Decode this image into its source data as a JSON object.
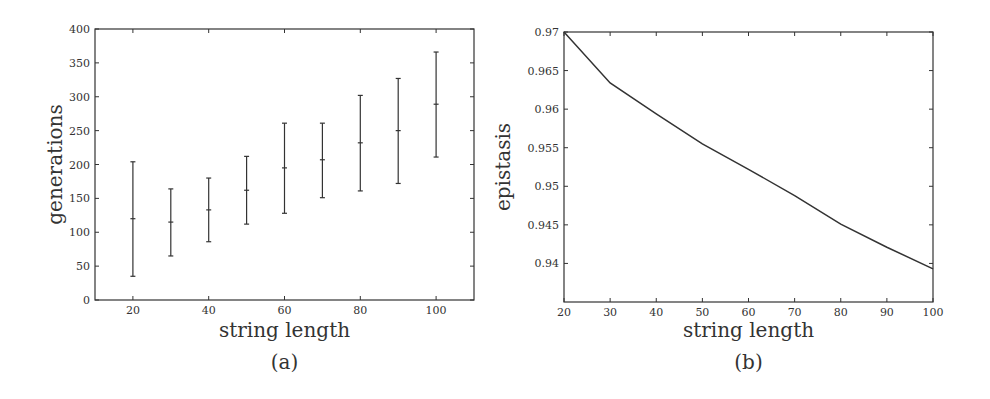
{
  "chart_data": [
    {
      "id": "a",
      "type": "errorbar",
      "caption": "(a)",
      "title": "",
      "xlabel": "string length",
      "ylabel": "generations",
      "xlim": [
        10,
        110
      ],
      "ylim": [
        0,
        400
      ],
      "xticks": [
        20,
        40,
        60,
        80,
        100
      ],
      "yticks": [
        0,
        50,
        100,
        150,
        200,
        250,
        300,
        350,
        400
      ],
      "grid": false,
      "legend": null,
      "x": [
        20,
        30,
        40,
        50,
        60,
        70,
        80,
        90,
        100
      ],
      "mean": [
        120,
        115,
        133,
        162,
        195,
        207,
        232,
        250,
        289
      ],
      "lower": [
        35,
        65,
        86,
        112,
        128,
        151,
        161,
        172,
        211
      ],
      "upper": [
        204,
        164,
        180,
        212,
        261,
        261,
        302,
        327,
        366
      ]
    },
    {
      "id": "b",
      "type": "line",
      "caption": "(b)",
      "title": "",
      "xlabel": "string length",
      "ylabel": "epistasis",
      "xlim": [
        20,
        100
      ],
      "ylim": [
        0.935,
        0.97
      ],
      "xticks": [
        20,
        30,
        40,
        50,
        60,
        70,
        80,
        90,
        100
      ],
      "yticks": [
        0.94,
        0.945,
        0.95,
        0.955,
        0.96,
        0.965,
        0.97
      ],
      "ytick_labels": [
        "0.94",
        "0.945",
        "0.95",
        "0.955",
        "0.96",
        "0.965",
        "0.97"
      ],
      "grid": false,
      "legend": null,
      "x": [
        20,
        30,
        40,
        50,
        60,
        70,
        80,
        90,
        100
      ],
      "y": [
        0.97,
        0.9634,
        0.9594,
        0.9555,
        0.9522,
        0.9488,
        0.9451,
        0.9421,
        0.9393
      ]
    }
  ],
  "layout": {
    "panels": [
      {
        "left": 95,
        "top": 29,
        "right": 474,
        "bottom": 300
      },
      {
        "left": 564,
        "top": 32,
        "right": 933,
        "bottom": 302
      }
    ],
    "line_color": "#333333"
  }
}
